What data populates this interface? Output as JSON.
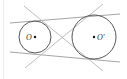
{
  "diagram": {
    "type": "geometry",
    "colors": {
      "circle_stroke": "#555555",
      "external_tangent": "#9a9a9a",
      "internal_tangent": "#b5b5b5",
      "point": "#111111",
      "label": "#333333",
      "background": "#ffffff"
    },
    "circles": [
      {
        "id": "small",
        "label": "O",
        "cx": 35,
        "cy": 37,
        "r": 16,
        "label_x": 26,
        "label_y": 40,
        "label_anchor": "start"
      },
      {
        "id": "large",
        "label": "O'",
        "cx": 94,
        "cy": 37,
        "r": 22,
        "label_x": 97,
        "label_y": 40,
        "label_anchor": "start"
      }
    ],
    "tangents": {
      "external": [
        {
          "id": "top-external",
          "x1": 10,
          "y1": 23,
          "x2": 120,
          "y2": 14
        },
        {
          "id": "bottom-external",
          "x1": 10,
          "y1": 52,
          "x2": 120,
          "y2": 62
        }
      ],
      "internal": [
        {
          "id": "internal-descending",
          "x1": 24,
          "y1": 6,
          "x2": 103,
          "y2": 71
        },
        {
          "id": "internal-ascending",
          "x1": 25,
          "y1": 68,
          "x2": 103,
          "y2": 4
        }
      ],
      "internal_intersection": {
        "x": 61,
        "y": 39
      }
    }
  }
}
